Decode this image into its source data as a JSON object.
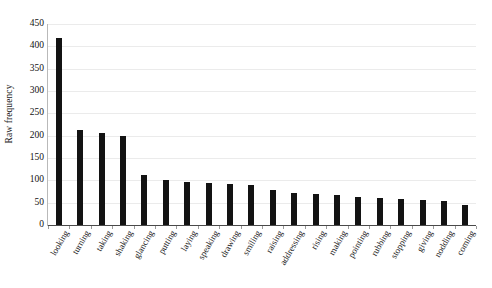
{
  "chart_data": {
    "type": "bar",
    "title": "",
    "subtitle": "",
    "xlabel": "",
    "ylabel": "Raw frequency",
    "ylim": [
      0,
      450
    ],
    "yticks": [
      0,
      50,
      100,
      150,
      200,
      250,
      300,
      350,
      400,
      450
    ],
    "grid": true,
    "legend": null,
    "bar_color": "#131313",
    "categories": [
      "looking",
      "turning",
      "taking",
      "shaking",
      "glancing",
      "putting",
      "laying",
      "speaking",
      "drawing",
      "smiling",
      "raising",
      "addressing",
      "rising",
      "making",
      "pointing",
      "rubbing",
      "stopping",
      "giving",
      "nodding",
      "coming"
    ],
    "values": [
      418,
      213,
      206,
      199,
      112,
      101,
      96,
      93,
      92,
      90,
      78,
      71,
      70,
      68,
      62,
      60,
      58,
      56,
      53,
      45
    ],
    "series": [
      {
        "name": "Raw frequency",
        "values": [
          418,
          213,
          206,
          199,
          112,
          101,
          96,
          93,
          92,
          90,
          78,
          71,
          70,
          68,
          62,
          60,
          58,
          56,
          53,
          45
        ]
      }
    ]
  },
  "axis": {
    "y_title": "Raw frequency",
    "y_tick_labels": [
      "450",
      "400",
      "350",
      "300",
      "250",
      "200",
      "150",
      "100",
      "50",
      "0"
    ]
  }
}
